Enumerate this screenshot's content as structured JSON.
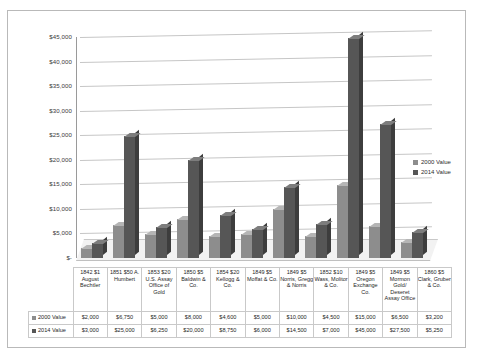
{
  "chart_data": {
    "type": "bar",
    "title": "",
    "xlabel": "",
    "ylabel": "",
    "ylim": [
      0,
      45000
    ],
    "ytick_labels": [
      "$45,000",
      "$40,000",
      "$35,000",
      "$30,000",
      "$25,000",
      "$20,000",
      "$15,000",
      "$10,000",
      "$5,000",
      "$-"
    ],
    "ytick_values": [
      45000,
      40000,
      35000,
      30000,
      25000,
      20000,
      15000,
      10000,
      5000,
      0
    ],
    "grid": true,
    "legend_position": "right",
    "categories": [
      "1842 $1 August Bechtler",
      "1851 $50 A. Humbert",
      "1853 $20 U.S. Assay Office of Gold",
      "1850 $5 Baldwin & Co.",
      "1854 $20 Kellogg & Co.",
      "1849 $5 Moffat & Co.",
      "1849 $5 Norris, Gregg & Norris",
      "1852 $10 Wass, Molitor & Co.",
      "1849 $5 Oregon Exchange Co.",
      "1849 $5 Mormon Gold/ Deseret Assay Office",
      "1860 $5 Clark, Gruber & Co."
    ],
    "series": [
      {
        "name": "2000 Value",
        "color": "#8d8d8d",
        "values": [
          2000,
          6750,
          5000,
          8000,
          4600,
          5000,
          10000,
          4500,
          15000,
          6500,
          3200
        ],
        "labels": [
          "$2,000",
          "$6,750",
          "$5,000",
          "$8,000",
          "$4,600",
          "$5,000",
          "$10,000",
          "$4,500",
          "$15,000",
          "$6,500",
          "$3,200"
        ]
      },
      {
        "name": "2014 Value",
        "color": "#565656",
        "values": [
          3000,
          25000,
          6250,
          20000,
          8750,
          6000,
          14500,
          7000,
          45000,
          27500,
          5250
        ],
        "labels": [
          "$3,000",
          "$25,000",
          "$6,250",
          "$20,000",
          "$8,750",
          "$6,000",
          "$14,500",
          "$7,000",
          "$45,000",
          "$27,500",
          "$5,250"
        ]
      }
    ]
  },
  "legend": {
    "entries": [
      {
        "label": "2000 Value"
      },
      {
        "label": "2014 Value"
      }
    ]
  },
  "data_table": {
    "row_headers": [
      "2000 Value",
      "2014 Value"
    ],
    "column_headers": [
      "1842 $1 August Bechtler",
      "1851 $50 A. Humbert",
      "1853 $20 U.S. Assay Office of Gold",
      "1850 $5 Baldwin & Co.",
      "1854 $20 Kellogg & Co.",
      "1849 $5 Moffat & Co.",
      "1849 $5 Norris, Gregg & Norris",
      "1852 $10 Wass, Molitor & Co.",
      "1849 $5 Oregon Exchange Co.",
      "1849 $5 Mormon Gold/ Deseret Assay Office",
      "1860 $5 Clark, Gruber & Co."
    ],
    "rows": [
      [
        "$2,000",
        "$6,750",
        "$5,000",
        "$8,000",
        "$4,600",
        "$5,000",
        "$10,000",
        "$4,500",
        "$15,000",
        "$6,500",
        "$3,200"
      ],
      [
        "$3,000",
        "$25,000",
        "$6,250",
        "$20,000",
        "$8,750",
        "$6,000",
        "$14,500",
        "$7,000",
        "$45,000",
        "$27,500",
        "$5,250"
      ]
    ]
  }
}
